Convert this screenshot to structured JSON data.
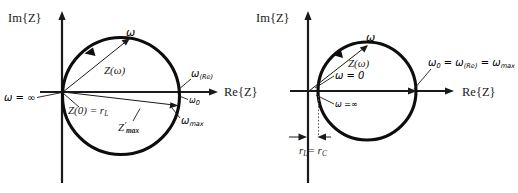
{
  "figure": {
    "background": "#ffffff",
    "ink_color": "#1a1a1a",
    "panels": [
      {
        "id": "left-panel",
        "name": "impedance-semicircle-with-inductive-offset",
        "axes": {
          "y_label": "Im{Z}",
          "x_label": "Re{Z}"
        },
        "labels": {
          "omega_infinity": "ω = ∞",
          "omega_arrow": "ω",
          "z_omega": "Z(ω)",
          "z_zero_rl": "Z(0) = r",
          "z_zero_rl_sub": "L",
          "z_max": "Z",
          "z_max_prime": "′",
          "z_max_sub": "max",
          "omega_re": "ω",
          "omega_re_sub": "(Re)",
          "omega_zero": "ω",
          "omega_zero_sub": "0",
          "omega_max": "ω",
          "omega_max_sub": "max"
        }
      },
      {
        "id": "right-panel",
        "name": "impedance-circle-resonant-equal-radii",
        "axes": {
          "y_label": "Im{Z}",
          "x_label": "Re{Z}"
        },
        "labels": {
          "omega_arrow": "ω",
          "z_omega": "Z(ω)",
          "omega_zero_eq": "ω = 0",
          "omega_infinity": "ω =∞",
          "omega_relation_w0": "ω",
          "omega_relation_w0_sub": "0",
          "omega_relation_eq1": " = ",
          "omega_relation_wre": "ω",
          "omega_relation_wre_sub": "(Re)",
          "omega_relation_eq2": " = ",
          "omega_relation_wmax": "ω",
          "omega_relation_wmax_sub": "max",
          "r_dimension_rl": "r",
          "r_dimension_rl_sub": "L",
          "r_dimension_eq": "= r",
          "r_dimension_rc_sub": "C"
        }
      }
    ]
  }
}
